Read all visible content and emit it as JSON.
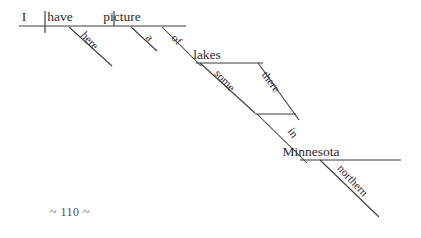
{
  "page": {
    "kind": "reed-kellogg-sentence-diagram",
    "sentence": "I have a picture of some lakes there in northern Minnesota here.",
    "background_color": "#ffffff",
    "ink_color": "#2b2b2b",
    "line_color": "#3a3a3a",
    "page_number_text": "~ 110 ~"
  },
  "baseline_words": [
    {
      "id": "subject",
      "label": "I",
      "x": 24,
      "y": 21,
      "role": "subject"
    },
    {
      "id": "verb",
      "label": "have",
      "x": 60,
      "y": 21,
      "role": "verb"
    },
    {
      "id": "direct-object",
      "label": "picture",
      "x": 122,
      "y": 21,
      "role": "direct-object"
    }
  ],
  "object_words": [
    {
      "id": "lakes",
      "label": "lakes",
      "x": 207,
      "y": 59,
      "role": "object-of-preposition"
    },
    {
      "id": "minnesota",
      "label": "Minnesota",
      "x": 311,
      "y": 156,
      "role": "object-of-preposition"
    }
  ],
  "modifier_words": [
    {
      "id": "here",
      "label": "here",
      "x": 87,
      "y": 43,
      "rotate": 47,
      "role": "adverb"
    },
    {
      "id": "a",
      "label": "a",
      "x": 147,
      "y": 40,
      "rotate": 47,
      "role": "article"
    },
    {
      "id": "of",
      "label": "of",
      "x": 174,
      "y": 42,
      "rotate": 47,
      "role": "preposition"
    },
    {
      "id": "some",
      "label": "some",
      "x": 222,
      "y": 83,
      "rotate": 47,
      "role": "determiner"
    },
    {
      "id": "there",
      "label": "there",
      "x": 268,
      "y": 84,
      "rotate": 54,
      "role": "adverb"
    },
    {
      "id": "in",
      "label": "in",
      "x": 290,
      "y": 135,
      "rotate": 54,
      "role": "preposition"
    },
    {
      "id": "northern",
      "label": "northern",
      "x": 350,
      "y": 183,
      "rotate": 47,
      "role": "adjective"
    }
  ],
  "lines": {
    "main_baseline": {
      "x1": 19,
      "y1": 26,
      "x2": 186,
      "y2": 26
    },
    "subject_verb_divider": {
      "x1": 45,
      "y1": 11,
      "x2": 45,
      "y2": 33
    },
    "verb_object_divider": {
      "x1": 114,
      "y1": 11,
      "x2": 114,
      "y2": 26
    },
    "here_slant": {
      "x1": 69,
      "y1": 27,
      "x2": 112,
      "y2": 66
    },
    "a_slant": {
      "x1": 131,
      "y1": 27,
      "x2": 157,
      "y2": 51
    },
    "of_slant": {
      "x1": 162,
      "y1": 27,
      "x2": 201,
      "y2": 66
    },
    "lakes_baseline": {
      "x1": 196,
      "y1": 63,
      "x2": 263,
      "y2": 63
    },
    "some_slant": {
      "x1": 200,
      "y1": 63,
      "x2": 255,
      "y2": 113
    },
    "there_slant": {
      "x1": 258,
      "y1": 63,
      "x2": 299,
      "y2": 120
    },
    "in_elbow": {
      "x1": 255,
      "y1": 114,
      "x2": 296,
      "y2": 114
    },
    "in_slant": {
      "x1": 257,
      "y1": 114,
      "x2": 307,
      "y2": 163
    },
    "minnesota_baseline": {
      "x1": 300,
      "y1": 160,
      "x2": 401,
      "y2": 160
    },
    "northern_slant": {
      "x1": 320,
      "y1": 160,
      "x2": 379,
      "y2": 217
    }
  },
  "page_number": {
    "label": "~ 110 ~",
    "x": 50,
    "y": 216
  }
}
